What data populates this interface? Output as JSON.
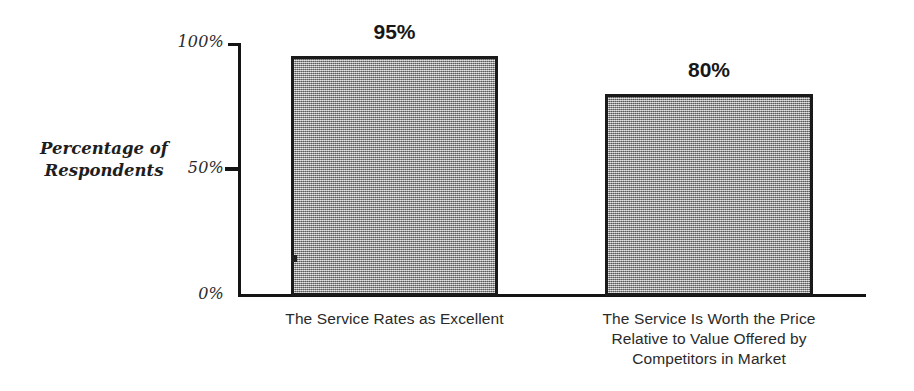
{
  "chart_data": {
    "type": "bar",
    "title": "",
    "subtitle": "",
    "xlabel": "",
    "ylabel": "Percentage of Respondents",
    "ylabel_lines": [
      "Percentage of",
      "Respondents"
    ],
    "categories": [
      "The Service Rates as Excellent",
      "The Service Is Worth the Price Relative to Value Offered by Competitors in Market"
    ],
    "category_lines": [
      [
        "The Service Rates as Excellent"
      ],
      [
        "The Service Is Worth the Price",
        "Relative to Value Offered by",
        "Competitors in Market"
      ]
    ],
    "values": [
      95,
      80
    ],
    "value_labels": [
      "95%",
      "80%"
    ],
    "ylim": [
      0,
      100
    ],
    "yticks": [
      0,
      50,
      100
    ],
    "ytick_labels": [
      "0%",
      "50%",
      "100%"
    ],
    "grid": false,
    "legend": false,
    "legend_position": "none",
    "units": "percent",
    "bar_fill_color": "#9c9c9c",
    "bar_border_color": "#1a1a1a",
    "axis_color": "#141414",
    "background_color": "#ffffff",
    "text_color": "#2a2a2a"
  },
  "axis": {
    "y_ticks": [
      {
        "label": "100%",
        "value": 100
      },
      {
        "label": "50%",
        "value": 50
      },
      {
        "label": "0%",
        "value": 0
      }
    ],
    "y_title_line_1": "Percentage of",
    "y_title_line_2": "Respondents"
  },
  "bars": [
    {
      "value_label": "95%",
      "category_line_1": "The Service Rates as Excellent"
    },
    {
      "value_label": "80%",
      "category_line_1": "The Service Is Worth the Price",
      "category_line_2": "Relative to Value Offered by",
      "category_line_3": "Competitors in Market"
    }
  ]
}
